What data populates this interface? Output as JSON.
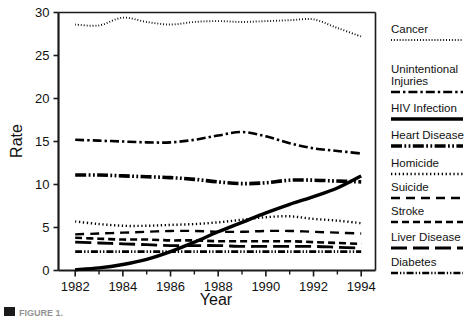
{
  "figure": {
    "caption_marker": "■",
    "caption_text": "FIGURE 1."
  },
  "chart_data": {
    "type": "line",
    "title": "",
    "xlabel": "Year",
    "ylabel": "Rate",
    "xlim": [
      1981.3,
      1994.6
    ],
    "ylim": [
      0,
      30
    ],
    "grid": false,
    "legend_position": "right",
    "x_tick_labels": [
      "1982",
      "1984",
      "1986",
      "1988",
      "1990",
      "1992",
      "1994"
    ],
    "x_tick_values": [
      1982,
      1984,
      1986,
      1988,
      1990,
      1992,
      1994
    ],
    "x_minor_tick_values": [
      1983,
      1985,
      1987,
      1989,
      1991,
      1993
    ],
    "y_tick_labels": [
      "0",
      "5",
      "10",
      "15",
      "20",
      "25",
      "30"
    ],
    "y_tick_values": [
      0,
      5,
      10,
      15,
      20,
      25,
      30
    ],
    "x": [
      1982,
      1983,
      1984,
      1985,
      1986,
      1987,
      1988,
      1989,
      1990,
      1991,
      1992,
      1993,
      1994
    ],
    "series": [
      {
        "name": "Cancer",
        "style": "dotted-fine",
        "values": [
          28.6,
          28.5,
          29.4,
          28.9,
          28.6,
          28.9,
          29.0,
          28.9,
          29.0,
          29.1,
          29.2,
          28.2,
          27.2
        ]
      },
      {
        "name": "Unintentional Injuries",
        "style": "dash-dot",
        "values": [
          15.2,
          15.1,
          15.0,
          14.9,
          14.9,
          15.2,
          15.7,
          16.1,
          15.6,
          14.8,
          14.2,
          13.9,
          13.6
        ]
      },
      {
        "name": "HIV Infection",
        "style": "solid-thick",
        "values": [
          0.1,
          0.3,
          0.7,
          1.3,
          2.2,
          3.3,
          4.5,
          5.6,
          6.7,
          7.7,
          8.6,
          9.6,
          11.0
        ]
      },
      {
        "name": "Heart Disease",
        "style": "dash-dot-dot-thick",
        "values": [
          11.1,
          11.1,
          11.0,
          10.9,
          10.8,
          10.6,
          10.3,
          10.1,
          10.2,
          10.5,
          10.5,
          10.4,
          10.3
        ]
      },
      {
        "name": "Homicide",
        "style": "dotted-round",
        "values": [
          5.7,
          5.4,
          5.2,
          5.2,
          5.3,
          5.4,
          5.6,
          5.9,
          6.2,
          6.3,
          6.0,
          5.8,
          5.5
        ]
      },
      {
        "name": "Suicide",
        "style": "dash-long",
        "values": [
          4.2,
          4.3,
          4.4,
          4.5,
          4.6,
          4.6,
          4.5,
          4.5,
          4.6,
          4.6,
          4.5,
          4.4,
          4.3
        ]
      },
      {
        "name": "Stroke",
        "style": "dash-medium",
        "values": [
          3.8,
          3.7,
          3.6,
          3.6,
          3.5,
          3.5,
          3.4,
          3.4,
          3.4,
          3.4,
          3.3,
          3.2,
          3.1
        ]
      },
      {
        "name": "Liver Disease",
        "style": "dash-solid-pair",
        "values": [
          3.3,
          3.2,
          3.1,
          3.0,
          2.9,
          2.9,
          2.9,
          2.8,
          2.8,
          2.8,
          2.8,
          2.7,
          2.6
        ]
      },
      {
        "name": "Diabetes",
        "style": "dash-dot-dot",
        "values": [
          2.2,
          2.2,
          2.2,
          2.2,
          2.2,
          2.2,
          2.2,
          2.2,
          2.2,
          2.2,
          2.2,
          2.2,
          2.2
        ]
      }
    ]
  },
  "legend": {
    "items": [
      {
        "label": "Cancer",
        "style": "dotted-fine"
      },
      {
        "label": "Unintentional",
        "label2": "Injuries",
        "style": "dash-dot"
      },
      {
        "label": "HIV Infection",
        "style": "solid-thick"
      },
      {
        "label": "Heart Disease",
        "style": "dash-dot-dot-thick"
      },
      {
        "label": "Homicide",
        "style": "dotted-round"
      },
      {
        "label": "Suicide",
        "style": "dash-long"
      },
      {
        "label": "Stroke",
        "style": "dash-medium"
      },
      {
        "label": "Liver Disease",
        "style": "dash-solid-pair"
      },
      {
        "label": "Diabetes",
        "style": "dash-dot-dot"
      }
    ]
  },
  "colors": {
    "ink": "#000000",
    "frame": "#1a1a1a",
    "background": "#ffffff"
  }
}
